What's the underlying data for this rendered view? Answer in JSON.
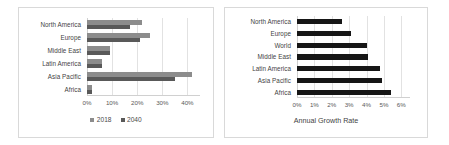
{
  "chart_data": [
    {
      "type": "bar",
      "orientation": "horizontal",
      "panel": "left",
      "title": "",
      "xlabel": "",
      "ylabel": "",
      "categories": [
        "North America",
        "Europe",
        "Middle East",
        "Latin America",
        "Asia Pacific",
        "Africa"
      ],
      "series": [
        {
          "name": "2018",
          "color": "#8c8c8c",
          "values": [
            22,
            25,
            9,
            6,
            42,
            2
          ]
        },
        {
          "name": "2040",
          "color": "#595959",
          "values": [
            17,
            21,
            9,
            6,
            35,
            2
          ]
        }
      ],
      "xlim": [
        0,
        45
      ],
      "xticks": [
        0,
        10,
        20,
        30,
        40
      ],
      "xticklabels": [
        "0%",
        "10%",
        "20%",
        "30%",
        "40%"
      ],
      "grid": true,
      "legend": [
        "2018",
        "2040"
      ],
      "legend_position": "bottom"
    },
    {
      "type": "bar",
      "orientation": "horizontal",
      "panel": "right",
      "title": "",
      "xlabel": "Annual Growth Rate",
      "ylabel": "",
      "categories": [
        "North America",
        "Europe",
        "World",
        "Middle East",
        "Latin America",
        "Asia Pacific",
        "Africa"
      ],
      "series": [
        {
          "name": "Annual Growth Rate",
          "color": "#161616",
          "values": [
            2.6,
            3.1,
            4.0,
            4.1,
            4.8,
            4.9,
            5.4
          ]
        }
      ],
      "xlim": [
        0,
        6.5
      ],
      "xticks": [
        0,
        1,
        2,
        3,
        4,
        5,
        6
      ],
      "xticklabels": [
        "0%",
        "1%",
        "2%",
        "3%",
        "4%",
        "5%",
        "6%"
      ],
      "grid": true,
      "legend": [],
      "legend_position": "none"
    }
  ],
  "left_chart": {
    "categories": [
      "North America",
      "Europe",
      "Middle East",
      "Latin America",
      "Asia Pacific",
      "Africa"
    ],
    "xticklabels": [
      "0%",
      "10%",
      "20%",
      "30%",
      "40%"
    ],
    "legend": [
      {
        "label": "2018",
        "color": "#8c8c8c"
      },
      {
        "label": "2040",
        "color": "#595959"
      }
    ]
  },
  "right_chart": {
    "categories": [
      "North America",
      "Europe",
      "World",
      "Middle East",
      "Latin America",
      "Asia Pacific",
      "Africa"
    ],
    "xticklabels": [
      "0%",
      "1%",
      "2%",
      "3%",
      "4%",
      "5%",
      "6%"
    ],
    "axis_title": "Annual Growth Rate"
  }
}
